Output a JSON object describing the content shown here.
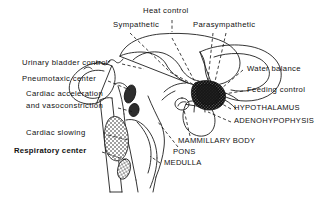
{
  "figure": {
    "ink_color": "#111111",
    "background_color": "#ffffff",
    "width": 315,
    "height": 198
  },
  "labels": {
    "heat_control": "Heat control",
    "sympathetic": "Sympathetic",
    "parasympathetic": "Parasympathetic",
    "water_balance": "Water balance",
    "feeding_control": "Feeding control",
    "hypothalamus": "HYPOTHALAMUS",
    "adenohypophysis": "ADENOHYPOPHYSIS",
    "mammillary_body": "MAMMILLARY BODY",
    "pons": "PONS",
    "medulla": "MEDULLA",
    "urinary_bladder_control": "Urinary bladder control",
    "pneumotaxic_center": "Pneumotaxic center",
    "cardiac_acceleration": "Cardiac acceleration",
    "and_vasoconstriction": "and vasoconstriction",
    "cardiac_slowing": "Cardiac slowing",
    "respiratory_center": "Respiratory center"
  }
}
